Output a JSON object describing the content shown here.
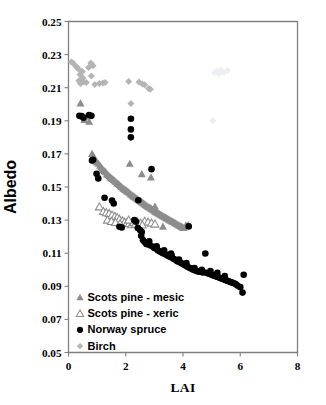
{
  "chart_data": {
    "type": "scatter",
    "title": "",
    "xlabel": "LAI",
    "ylabel": "Albedo",
    "xlim": [
      0,
      8
    ],
    "ylim": [
      0.05,
      0.25
    ],
    "xticks": [
      "0",
      "2",
      "4",
      "6",
      "8"
    ],
    "xtick_values": [
      0,
      2,
      4,
      6,
      8
    ],
    "yticks": [
      "0.05",
      "0.07",
      "0.09",
      "0.11",
      "0.13",
      "0.15",
      "0.17",
      "0.19",
      "0.21",
      "0.23",
      "0.25"
    ],
    "ytick_values": [
      0.05,
      0.07,
      0.09,
      0.11,
      0.13,
      0.15,
      0.17,
      0.19,
      0.21,
      0.23,
      0.25
    ],
    "grid": false,
    "legend_position": "lower-left-inside",
    "series": [
      {
        "name": "Scots pine - mesic",
        "marker": "triangle-filled",
        "color": "#8c8c8c",
        "points": [
          [
            0.42,
            0.2005
          ],
          [
            0.55,
            0.1905
          ],
          [
            0.62,
            0.1925
          ],
          [
            0.72,
            0.1895
          ],
          [
            0.82,
            0.17
          ],
          [
            0.86,
            0.169
          ],
          [
            0.88,
            0.1672
          ],
          [
            0.92,
            0.166
          ],
          [
            0.96,
            0.1655
          ],
          [
            1.0,
            0.1648
          ],
          [
            1.05,
            0.164
          ],
          [
            1.1,
            0.1628
          ],
          [
            1.14,
            0.1618
          ],
          [
            1.18,
            0.161
          ],
          [
            1.22,
            0.16
          ],
          [
            1.26,
            0.1596
          ],
          [
            1.3,
            0.159
          ],
          [
            1.34,
            0.1578
          ],
          [
            1.38,
            0.1572
          ],
          [
            1.42,
            0.1565
          ],
          [
            1.46,
            0.1558
          ],
          [
            1.5,
            0.1552
          ],
          [
            1.54,
            0.1548
          ],
          [
            1.58,
            0.1542
          ],
          [
            1.62,
            0.1535
          ],
          [
            1.66,
            0.153
          ],
          [
            1.7,
            0.1522
          ],
          [
            1.74,
            0.1518
          ],
          [
            1.78,
            0.1512
          ],
          [
            1.82,
            0.1505
          ],
          [
            1.86,
            0.15
          ],
          [
            1.9,
            0.1492
          ],
          [
            1.94,
            0.1488
          ],
          [
            1.98,
            0.1482
          ],
          [
            2.02,
            0.1478
          ],
          [
            2.06,
            0.1472
          ],
          [
            2.1,
            0.1468
          ],
          [
            2.14,
            0.1462
          ],
          [
            2.18,
            0.1455
          ],
          [
            2.22,
            0.145
          ],
          [
            2.14,
            0.164
          ],
          [
            2.26,
            0.1445
          ],
          [
            2.3,
            0.144
          ],
          [
            2.34,
            0.1435
          ],
          [
            2.38,
            0.143
          ],
          [
            2.42,
            0.1425
          ],
          [
            2.46,
            0.142
          ],
          [
            2.5,
            0.1415
          ],
          [
            2.54,
            0.141
          ],
          [
            2.58,
            0.1405
          ],
          [
            2.62,
            0.14
          ],
          [
            2.66,
            0.1395
          ],
          [
            2.7,
            0.139
          ],
          [
            2.74,
            0.1385
          ],
          [
            2.78,
            0.138
          ],
          [
            2.82,
            0.1376
          ],
          [
            2.86,
            0.1372
          ],
          [
            2.9,
            0.1368
          ],
          [
            2.94,
            0.1362
          ],
          [
            2.98,
            0.1358
          ],
          [
            2.56,
            0.1578
          ],
          [
            3.02,
            0.1352
          ],
          [
            3.06,
            0.1348
          ],
          [
            3.1,
            0.1344
          ],
          [
            3.14,
            0.134
          ],
          [
            3.18,
            0.1336
          ],
          [
            3.22,
            0.1332
          ],
          [
            3.26,
            0.1328
          ],
          [
            3.3,
            0.1324
          ],
          [
            3.34,
            0.132
          ],
          [
            3.38,
            0.1316
          ],
          [
            3.42,
            0.1312
          ],
          [
            3.46,
            0.1308
          ],
          [
            3.5,
            0.1304
          ],
          [
            3.54,
            0.13
          ],
          [
            3.58,
            0.1296
          ],
          [
            3.62,
            0.1292
          ],
          [
            3.66,
            0.1288
          ],
          [
            3.7,
            0.1284
          ],
          [
            3.74,
            0.128
          ],
          [
            3.78,
            0.1276
          ],
          [
            3.82,
            0.1272
          ],
          [
            3.86,
            0.1268
          ],
          [
            3.9,
            0.1264
          ],
          [
            3.94,
            0.126
          ],
          [
            3.98,
            0.1256
          ],
          [
            4.02,
            0.1252
          ],
          [
            4.1,
            0.1268
          ],
          [
            4.18,
            0.127
          ],
          [
            3.3,
            0.126
          ],
          [
            2.88,
            0.1558
          ],
          [
            3.02,
            0.1382
          ]
        ]
      },
      {
        "name": "Scots pine - xeric",
        "marker": "triangle-open",
        "color": "#8c8c8c",
        "points": [
          [
            1.08,
            0.138
          ],
          [
            1.22,
            0.1352
          ],
          [
            1.32,
            0.1345
          ],
          [
            1.42,
            0.134
          ],
          [
            1.52,
            0.133
          ],
          [
            1.62,
            0.1322
          ],
          [
            1.7,
            0.1315
          ],
          [
            1.78,
            0.1305
          ],
          [
            1.88,
            0.1295
          ],
          [
            1.96,
            0.1288
          ],
          [
            2.04,
            0.1282
          ],
          [
            2.12,
            0.1278
          ],
          [
            2.2,
            0.1272
          ],
          [
            2.28,
            0.1285
          ],
          [
            2.4,
            0.129
          ],
          [
            2.52,
            0.1282
          ],
          [
            2.66,
            0.1292
          ],
          [
            2.78,
            0.1288
          ],
          [
            2.9,
            0.1282
          ],
          [
            3.02,
            0.1276
          ],
          [
            1.36,
            0.13
          ],
          [
            1.5,
            0.1292
          ],
          [
            1.64,
            0.1286
          ],
          [
            1.8,
            0.1278
          ],
          [
            2.1,
            0.13
          ],
          [
            2.34,
            0.1275
          ],
          [
            2.58,
            0.127
          ]
        ]
      },
      {
        "name": "Norway spruce",
        "marker": "circle-filled",
        "color": "#000000",
        "points": [
          [
            0.38,
            0.193
          ],
          [
            0.46,
            0.1928
          ],
          [
            0.52,
            0.1918
          ],
          [
            0.72,
            0.1935
          ],
          [
            0.8,
            0.193
          ],
          [
            0.82,
            0.166
          ],
          [
            0.86,
            0.1665
          ],
          [
            0.98,
            0.158
          ],
          [
            1.04,
            0.1552
          ],
          [
            1.26,
            0.1435
          ],
          [
            1.52,
            0.1418
          ],
          [
            1.58,
            0.14
          ],
          [
            1.78,
            0.126
          ],
          [
            1.86,
            0.1255
          ],
          [
            2.18,
            0.1912
          ],
          [
            2.18,
            0.1848
          ],
          [
            2.18,
            0.18
          ],
          [
            2.3,
            0.13
          ],
          [
            2.36,
            0.129
          ],
          [
            2.44,
            0.142
          ],
          [
            2.5,
            0.124
          ],
          [
            2.54,
            0.1205
          ],
          [
            2.6,
            0.118
          ],
          [
            2.66,
            0.1168
          ],
          [
            2.72,
            0.1155
          ],
          [
            2.78,
            0.1162
          ],
          [
            2.84,
            0.1148
          ],
          [
            2.9,
            0.1608
          ],
          [
            2.94,
            0.114
          ],
          [
            3.0,
            0.1132
          ],
          [
            3.06,
            0.1128
          ],
          [
            3.12,
            0.1118
          ],
          [
            3.18,
            0.1112
          ],
          [
            3.24,
            0.1106
          ],
          [
            3.3,
            0.11
          ],
          [
            3.36,
            0.1096
          ],
          [
            3.42,
            0.109
          ],
          [
            3.48,
            0.1085
          ],
          [
            3.54,
            0.1078
          ],
          [
            3.58,
            0.1098
          ],
          [
            3.62,
            0.1072
          ],
          [
            3.68,
            0.1065
          ],
          [
            3.74,
            0.106
          ],
          [
            3.8,
            0.1052
          ],
          [
            3.86,
            0.1048
          ],
          [
            3.92,
            0.1042
          ],
          [
            3.98,
            0.1036
          ],
          [
            4.04,
            0.103
          ],
          [
            4.1,
            0.1024
          ],
          [
            4.16,
            0.1018
          ],
          [
            4.22,
            0.1012
          ],
          [
            4.2,
            0.1262
          ],
          [
            4.28,
            0.1008
          ],
          [
            4.34,
            0.1002
          ],
          [
            4.4,
            0.0998
          ],
          [
            4.46,
            0.0994
          ],
          [
            4.52,
            0.099
          ],
          [
            4.58,
            0.0988
          ],
          [
            4.64,
            0.0986
          ],
          [
            4.7,
            0.0984
          ],
          [
            4.78,
            0.1098
          ],
          [
            4.82,
            0.0982
          ],
          [
            4.88,
            0.0978
          ],
          [
            4.94,
            0.0974
          ],
          [
            5.0,
            0.097
          ],
          [
            5.06,
            0.0966
          ],
          [
            5.12,
            0.0962
          ],
          [
            5.18,
            0.0958
          ],
          [
            5.24,
            0.0954
          ],
          [
            5.3,
            0.095
          ],
          [
            5.36,
            0.0946
          ],
          [
            5.42,
            0.0942
          ],
          [
            5.48,
            0.0938
          ],
          [
            5.54,
            0.0934
          ],
          [
            5.6,
            0.093
          ],
          [
            5.66,
            0.0926
          ],
          [
            5.72,
            0.0922
          ],
          [
            5.78,
            0.0918
          ],
          [
            5.84,
            0.0914
          ],
          [
            5.9,
            0.0905
          ],
          [
            6.0,
            0.0895
          ],
          [
            6.08,
            0.0862
          ],
          [
            6.12,
            0.097
          ],
          [
            5.46,
            0.0962
          ],
          [
            5.2,
            0.0982
          ],
          [
            4.96,
            0.0992
          ],
          [
            4.66,
            0.1
          ],
          [
            4.4,
            0.101
          ],
          [
            4.12,
            0.104
          ],
          [
            3.86,
            0.1062
          ],
          [
            3.6,
            0.1088
          ],
          [
            3.34,
            0.1118
          ],
          [
            3.08,
            0.1142
          ],
          [
            2.82,
            0.1172
          ],
          [
            2.56,
            0.1228
          ],
          [
            2.42,
            0.1252
          ]
        ]
      },
      {
        "name": "Birch",
        "marker": "diamond-filled",
        "color": "#b4b4b4",
        "points": [
          [
            0.1,
            0.2255
          ],
          [
            0.16,
            0.225
          ],
          [
            0.24,
            0.2232
          ],
          [
            0.3,
            0.2222
          ],
          [
            0.34,
            0.2215
          ],
          [
            0.4,
            0.218
          ],
          [
            0.42,
            0.2125
          ],
          [
            0.5,
            0.2158
          ],
          [
            0.54,
            0.2135
          ],
          [
            0.62,
            0.2132
          ],
          [
            0.7,
            0.2222
          ],
          [
            0.78,
            0.225
          ],
          [
            0.8,
            0.217
          ],
          [
            0.86,
            0.2232
          ],
          [
            0.92,
            0.212
          ],
          [
            1.08,
            0.2125
          ],
          [
            1.2,
            0.2128
          ],
          [
            1.28,
            0.2132
          ],
          [
            2.1,
            0.2138
          ],
          [
            2.18,
            0.2005
          ],
          [
            2.46,
            0.2135
          ],
          [
            2.58,
            0.2122
          ],
          [
            2.66,
            0.2118
          ],
          [
            2.8,
            0.2095
          ],
          [
            2.86,
            0.209
          ],
          [
            5.18,
            0.22
          ],
          [
            5.32,
            0.2208
          ],
          [
            5.42,
            0.2192
          ],
          [
            5.56,
            0.2205
          ],
          [
            5.1,
            0.219
          ],
          [
            5.26,
            0.2185
          ],
          [
            5.04,
            0.19
          ],
          [
            0.48,
            0.2198
          ],
          [
            0.36,
            0.2142
          ]
        ]
      }
    ]
  },
  "legend": {
    "items": [
      {
        "label": "Scots pine - mesic",
        "marker": "triangle-filled",
        "color": "#8c8c8c"
      },
      {
        "label": "Scots pine - xeric",
        "marker": "triangle-open",
        "color": "#8c8c8c"
      },
      {
        "label": "Norway spruce",
        "marker": "circle-filled",
        "color": "#000000"
      },
      {
        "label": "Birch",
        "marker": "diamond-filled",
        "color": "#b4b4b4"
      }
    ]
  },
  "colors": {
    "axis": "#808080",
    "text": "#000000",
    "background": "#ffffff",
    "mesic": "#8c8c8c",
    "xeric": "#8c8c8c",
    "spruce": "#000000",
    "birch": "#b4b4b4"
  }
}
